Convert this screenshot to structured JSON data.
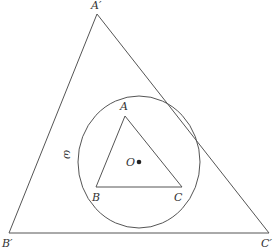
{
  "diagram": {
    "title": "",
    "colors": {
      "stroke": "#555555",
      "text": "#333333",
      "background": "#ffffff"
    },
    "outer_triangle": {
      "vertices": [
        {
          "name": "A'",
          "label": "A′",
          "x": 97,
          "y": 14
        },
        {
          "name": "B'",
          "label": "B′",
          "x": 9,
          "y": 233
        },
        {
          "name": "C'",
          "label": "C′",
          "x": 269,
          "y": 233
        }
      ]
    },
    "inner_triangle": {
      "vertices": [
        {
          "name": "A",
          "label": "A",
          "x": 125,
          "y": 116
        },
        {
          "name": "B",
          "label": "B",
          "x": 96,
          "y": 187
        },
        {
          "name": "C",
          "label": "C",
          "x": 182,
          "y": 187
        }
      ]
    },
    "circle": {
      "label": "ω",
      "cx": 139,
      "cy": 162,
      "rx": 61,
      "ry": 66
    },
    "center_point": {
      "label": "O",
      "x": 139,
      "y": 162
    }
  }
}
